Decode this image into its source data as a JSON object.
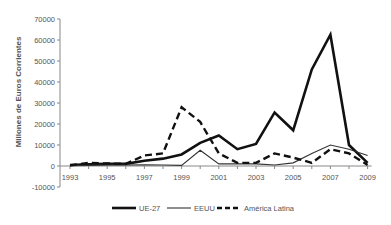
{
  "chart_data": {
    "type": "line",
    "title": "",
    "xlabel": "",
    "ylabel": "Millones de Euros Corrientes",
    "ylim": [
      -10000,
      70000
    ],
    "yticks": [
      -10000,
      0,
      10000,
      20000,
      30000,
      40000,
      50000,
      60000,
      70000
    ],
    "x": [
      1993,
      1994,
      1995,
      1996,
      1997,
      1998,
      1999,
      2000,
      2001,
      2002,
      2003,
      2004,
      2005,
      2006,
      2007,
      2008,
      2009
    ],
    "xtick_labels": [
      "1993",
      "1995",
      "1997",
      "1999",
      "2001",
      "2003",
      "2005",
      "2007",
      "2009"
    ],
    "grid": false,
    "legend_position": "bottom",
    "series": [
      {
        "name": "UE-27",
        "style": "thick-solid",
        "values": [
          500,
          800,
          1000,
          1000,
          2500,
          3500,
          5500,
          11000,
          14500,
          8000,
          10500,
          25500,
          17000,
          46000,
          62500,
          10000,
          1500
        ]
      },
      {
        "name": "EEUU",
        "style": "thin-solid",
        "values": [
          200,
          300,
          500,
          500,
          600,
          500,
          300,
          7500,
          1000,
          1000,
          1000,
          500,
          1500,
          6000,
          10000,
          8000,
          5000
        ]
      },
      {
        "name": "América Latina",
        "style": "dashed",
        "values": [
          300,
          1500,
          1200,
          1000,
          5000,
          6000,
          28000,
          21000,
          6000,
          1500,
          1500,
          6000,
          4000,
          1500,
          8000,
          6000,
          500
        ]
      }
    ]
  },
  "legend": {
    "items": [
      "UE-27",
      "EEUU",
      "América Latina"
    ]
  }
}
